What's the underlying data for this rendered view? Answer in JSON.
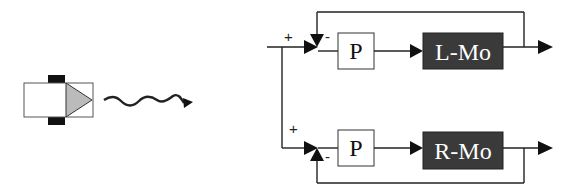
{
  "diagram": {
    "type": "block-diagram",
    "robot": {
      "body_color": "#ffffff",
      "heading_triangle_color": "#bbbbbb",
      "wheel_color": "#111111",
      "motion_arrow": "wavy-arrow"
    },
    "top_loop": {
      "input_sign": "+",
      "feedback_sign": "-",
      "controller_label": "P",
      "motor_label": "L-Mo"
    },
    "bottom_loop": {
      "input_sign": "+",
      "feedback_sign": "-",
      "controller_label": "P",
      "motor_label": "R-Mo"
    },
    "colors": {
      "motor_block_fill": "#3a3a3a",
      "motor_text": "#ffffff",
      "controller_fill": "#ffffff",
      "line": "#222222"
    }
  }
}
